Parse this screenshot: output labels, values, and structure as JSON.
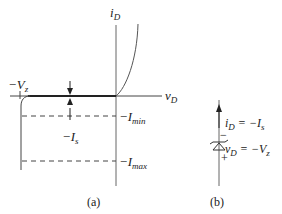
{
  "panel_a": {
    "y_axis_label": {
      "base": "i",
      "sub": "D"
    },
    "x_axis_label": {
      "base": "v",
      "sub": "D"
    },
    "breakdown_label": {
      "prefix": "−V",
      "sub": "z"
    },
    "saturation_label": {
      "prefix": "−I",
      "sub": "s"
    },
    "imin_label": {
      "prefix": "−I",
      "sub": "min"
    },
    "imax_label": {
      "prefix": "−I",
      "sub": "max"
    },
    "caption": "(a)"
  },
  "panel_b": {
    "current_label": {
      "base": "i",
      "sub": "D",
      "rhs_prefix": " = −I",
      "rhs_sub": "s"
    },
    "voltage_label": {
      "base": "v",
      "sub": "D",
      "rhs_prefix": " = −V",
      "rhs_sub": "z"
    },
    "minus_sign": "−",
    "plus_sign": "+",
    "caption": "(b)"
  },
  "colors": {
    "line": "#333333",
    "axis": "#555555"
  }
}
